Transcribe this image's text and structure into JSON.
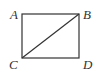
{
  "diagram": {
    "type": "geometry-rectangle-with-diagonal",
    "points": {
      "A": {
        "label": "A",
        "x": 22,
        "y": 14
      },
      "B": {
        "label": "B",
        "x": 79,
        "y": 14
      },
      "C": {
        "label": "C",
        "x": 22,
        "y": 58
      },
      "D": {
        "label": "D",
        "x": 79,
        "y": 58
      }
    },
    "segments": [
      {
        "from": "A",
        "to": "B"
      },
      {
        "from": "B",
        "to": "D"
      },
      {
        "from": "D",
        "to": "C"
      },
      {
        "from": "C",
        "to": "A"
      },
      {
        "from": "C",
        "to": "B"
      }
    ],
    "line_color": "#333333"
  }
}
